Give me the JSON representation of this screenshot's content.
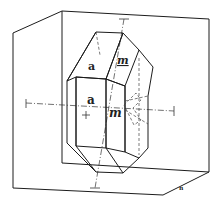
{
  "figure": {
    "face_labels": {
      "top_front": "a",
      "top_side": "m",
      "front": "a",
      "side": "m"
    },
    "corner_label": "n"
  }
}
